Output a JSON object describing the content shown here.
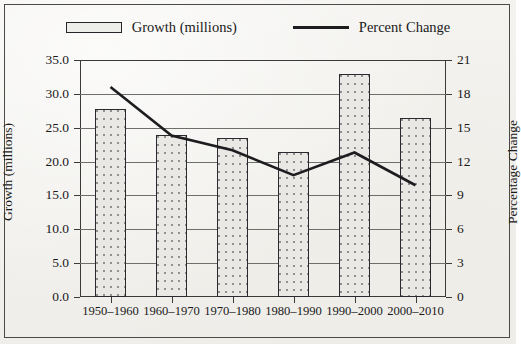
{
  "chart_data": {
    "type": "bar",
    "title": "",
    "xlabel": "",
    "ylabel": "Growth (millions)",
    "y2label": "Percentage Change",
    "categories": [
      "1950–1960",
      "1960–1970",
      "1970–1980",
      "1980–1990",
      "1990–2000",
      "2000–2010"
    ],
    "grid": true,
    "legend_position": "top",
    "ylim": [
      0,
      35
    ],
    "yticks": [
      "0.0",
      "5.0",
      "10.0",
      "15.0",
      "20.0",
      "25.0",
      "30.0",
      "35.0"
    ],
    "ytick_values": [
      0,
      5,
      10,
      15,
      20,
      25,
      30,
      35
    ],
    "y2lim": [
      0,
      21
    ],
    "y2ticks": [
      "0",
      "3",
      "6",
      "9",
      "12",
      "15",
      "18",
      "21"
    ],
    "y2tick_values": [
      0,
      3,
      6,
      9,
      12,
      15,
      18,
      21
    ],
    "series": [
      {
        "name": "Growth (millions)",
        "type": "bar",
        "axis": "left",
        "values": [
          27.7,
          24.0,
          23.5,
          21.4,
          33.0,
          26.5
        ],
        "fill": "stipple",
        "edge_color": "#2a2a2e"
      },
      {
        "name": "Percent Change",
        "type": "line",
        "axis": "right",
        "values": [
          18.6,
          14.3,
          13.0,
          10.8,
          12.8,
          9.9
        ],
        "line_color": "#1d1d20"
      }
    ]
  },
  "legend": {
    "items": [
      {
        "label": "Growth (millions)",
        "marker": "bar-swatch"
      },
      {
        "label": "Percent Change",
        "marker": "line-swatch"
      }
    ]
  }
}
